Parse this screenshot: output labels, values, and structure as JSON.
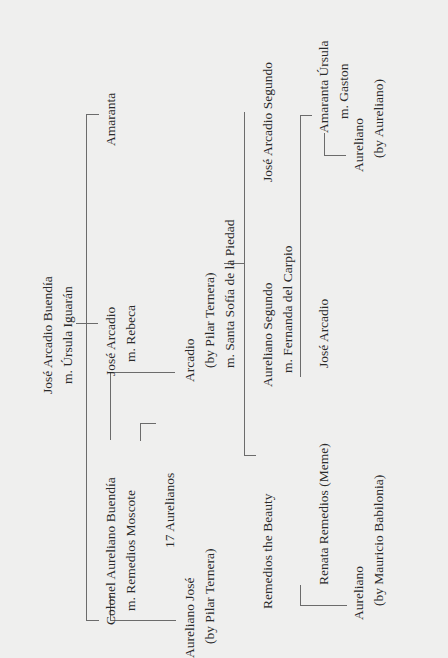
{
  "tree": {
    "root": {
      "name": "José Arcadio Buendía",
      "spouse": "m. Úrsula Iguarán"
    },
    "gen2": [
      {
        "name": "Colonel Aureliano Buendía",
        "spouse": "m. Remedios Moscote"
      },
      {
        "name": "José Arcadio",
        "spouse": "m. Rebeca"
      },
      {
        "name": "Amaranta"
      }
    ],
    "gen2_children": {
      "aureliano_jose": {
        "name": "Aureliano José",
        "note": "(by Pilar Ternera)"
      },
      "seventeen": {
        "name": "17 Aurelianos"
      },
      "arcadio": {
        "name": "Arcadio",
        "note": "(by Pilar Ternera)",
        "spouse": "m. Santa Sofía de la Piedad"
      }
    },
    "gen3": [
      {
        "name": "Remedios the Beauty"
      },
      {
        "name": "Aureliano Segundo",
        "spouse": "m. Fernanda del Carpio"
      },
      {
        "name": "José Arcadio Segundo"
      }
    ],
    "gen4": [
      {
        "name": "Renata Remedios (Meme)"
      },
      {
        "name": "José Arcadio"
      },
      {
        "name": "Amaranta Úrsula",
        "spouse": "m. Gaston"
      }
    ],
    "gen5": {
      "aureliano_meme": {
        "name": "Aureliano",
        "note": "(by Mauricio Babilonia)"
      },
      "aureliano_amaranta": {
        "name": "Aureliano",
        "note": "(by Aureliano)"
      }
    }
  }
}
